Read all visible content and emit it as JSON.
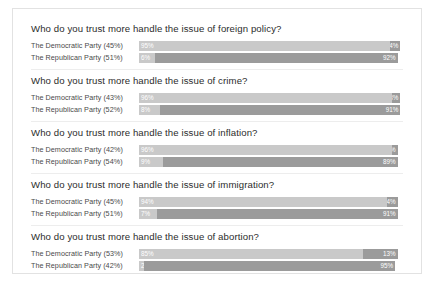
{
  "chart_data": {
    "type": "bar",
    "title": "",
    "subtitle": "",
    "xlabel": "",
    "ylabel": "",
    "grid": false,
    "legend_position": "none",
    "orientation": "horizontal",
    "stacked": true,
    "xlim": [
      0,
      100
    ],
    "series": [
      {
        "name": "left-segment",
        "color": "#c9c9c9"
      },
      {
        "name": "right-segment",
        "color": "#9b9b9b"
      }
    ],
    "groups": [
      {
        "question": "Who do you trust more handle the issue of foreign policy?",
        "rows": [
          {
            "label": "The Democratic Party (45%)",
            "left_value": 95,
            "left_text": "95%",
            "right_value": 4,
            "right_text": "4%"
          },
          {
            "label": "The Republican Party (51%)",
            "left_value": 6,
            "left_text": "6%",
            "right_value": 92,
            "right_text": "92%"
          }
        ]
      },
      {
        "question": "Who do you trust more handle the issue of crime?",
        "rows": [
          {
            "label": "The Democratic Party (43%)",
            "left_value": 96,
            "left_text": "96%",
            "right_value": 3,
            "right_text": "3%"
          },
          {
            "label": "The Republican Party (52%)",
            "left_value": 8,
            "left_text": "8%",
            "right_value": 91,
            "right_text": "91%"
          }
        ]
      },
      {
        "question": "Who do you trust more handle the issue of inflation?",
        "rows": [
          {
            "label": "The Democratic Party (42%)",
            "left_value": 96,
            "left_text": "96%",
            "right_value": 2,
            "right_text": "2%"
          },
          {
            "label": "The Republican Party (54%)",
            "left_value": 9,
            "left_text": "9%",
            "right_value": 89,
            "right_text": "89%"
          }
        ]
      },
      {
        "question": "Who do you trust more handle the issue of immigration?",
        "rows": [
          {
            "label": "The Democratic Party (45%)",
            "left_value": 94,
            "left_text": "94%",
            "right_value": 4,
            "right_text": "4%"
          },
          {
            "label": "The Republican Party (51%)",
            "left_value": 7,
            "left_text": "7%",
            "right_value": 91,
            "right_text": "91%"
          }
        ]
      },
      {
        "question": "Who do you trust more handle the issue of abortion?",
        "rows": [
          {
            "label": "The Democratic Party (53%)",
            "left_value": 85,
            "left_text": "85%",
            "right_value": 13,
            "right_text": "13%"
          },
          {
            "label": "The Republican Party (42%)",
            "left_value": 2,
            "left_text": "2%",
            "right_value": 95,
            "right_text": "95%"
          }
        ]
      }
    ]
  },
  "colors": {
    "segment_light": "#c9c9c9",
    "segment_dark": "#9b9b9b",
    "card_border": "#e2e2e2",
    "divider": "#ededed",
    "question_text": "#2c2c2c",
    "label_text": "#4a4a4a",
    "value_text": "#ffffff",
    "background": "#ffffff"
  }
}
